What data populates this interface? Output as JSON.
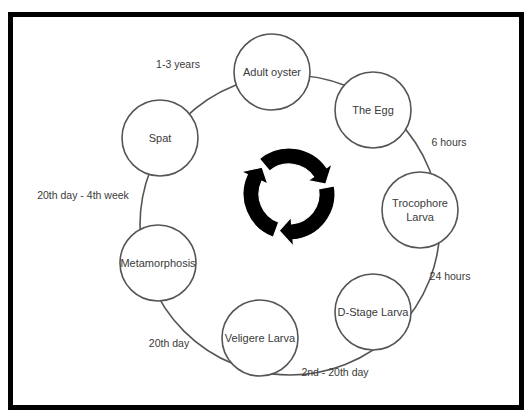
{
  "diagram": {
    "frame_color": "#000000",
    "stroke_color": "#555555",
    "ring": {
      "cx": 290,
      "cy": 225,
      "r": 150
    },
    "stages": [
      {
        "id": "adult-oyster",
        "lines": [
          "Adult  oyster"
        ],
        "cx": 272,
        "cy": 72,
        "r": 38
      },
      {
        "id": "the-egg",
        "lines": [
          "The Egg"
        ],
        "cx": 373,
        "cy": 110,
        "r": 38
      },
      {
        "id": "trocophore-larva",
        "lines": [
          "Trocophore",
          "Larva"
        ],
        "cx": 420,
        "cy": 210,
        "r": 38
      },
      {
        "id": "d-stage-larva",
        "lines": [
          "D-Stage Larva"
        ],
        "cx": 373,
        "cy": 312,
        "r": 38
      },
      {
        "id": "veligere-larva",
        "lines": [
          "Veligere Larva"
        ],
        "cx": 260,
        "cy": 338,
        "r": 38
      },
      {
        "id": "metamorphosis",
        "lines": [
          "Metamorphosis"
        ],
        "cx": 158,
        "cy": 263,
        "r": 38
      },
      {
        "id": "spat",
        "lines": [
          "Spat"
        ],
        "cx": 160,
        "cy": 138,
        "r": 38
      }
    ],
    "durations": [
      {
        "id": "adult-to-egg",
        "text": "1-3 years",
        "x": 178,
        "y": 68
      },
      {
        "id": "egg-to-trocophore",
        "text": "6 hours",
        "x": 449,
        "y": 146
      },
      {
        "id": "trocophore-to-dstage",
        "text": "24 hours",
        "x": 450,
        "y": 280
      },
      {
        "id": "dstage-to-veligere",
        "text": "2nd - 20th day",
        "x": 335,
        "y": 376
      },
      {
        "id": "veligere-to-metamorphosis",
        "text": "20th day",
        "x": 169,
        "y": 347
      },
      {
        "id": "metamorphosis-to-spat",
        "text": "20th day - 4th week",
        "x": 83,
        "y": 199
      }
    ],
    "center_icon": {
      "name": "cycle-arrows-icon",
      "cx": 289,
      "cy": 194,
      "r_outer": 46,
      "r_inner": 30,
      "color": "#000000"
    }
  }
}
